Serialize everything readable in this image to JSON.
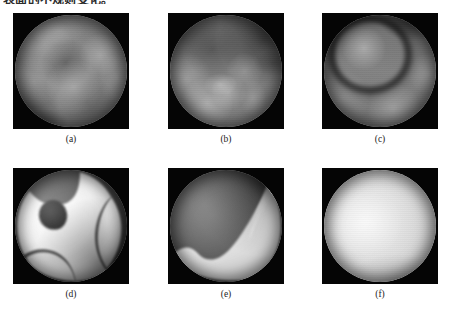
{
  "heading": {
    "text": "表面的不规则变化。",
    "note": "top line clipped by image crop"
  },
  "figure": {
    "layout": {
      "rows": 2,
      "columns": 3
    },
    "panels": [
      {
        "id": "panel-a",
        "caption": "(a)",
        "description": "grayscale circular endoscopic frame, mottled mid-gray texture with diffuse bright lobes and a faint dark band across the middle",
        "style_key": "pa"
      },
      {
        "id": "panel-b",
        "caption": "(b)",
        "description": "grayscale circular frame, darker upper-right quadrant with clustered bright lumps in the lower-left half",
        "style_key": "pb"
      },
      {
        "id": "panel-c",
        "caption": "(c)",
        "description": "grayscale circular frame with a pronounced dark annular ring in the upper-left region surrounding a brighter core",
        "style_key": "pc"
      },
      {
        "id": "panel-d",
        "caption": "(d)",
        "description": "high-contrast segmentation result: dark irregular blob upper-left with bright sweeping crescent bands across the disc",
        "style_key": "pd"
      },
      {
        "id": "panel-e",
        "caption": "(e)",
        "description": "segmentation result: dark shaded interior with a bright crescent band following the lower-right rim",
        "style_key": "pe"
      },
      {
        "id": "panel-f",
        "caption": "(f)",
        "description": "segmentation result: nearly uniform bright disc with a soft highlight left of center",
        "style_key": "pf"
      }
    ]
  },
  "colors": {
    "page_background": "#ffffff",
    "frame_background": "#050505",
    "caption_text": "#1c1c1c",
    "heading_text": "#2b2b2b"
  }
}
